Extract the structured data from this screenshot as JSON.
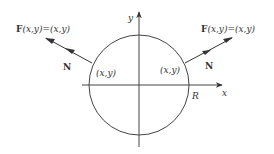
{
  "diagram": {
    "axes": {
      "x_label": "x",
      "y_label": "y"
    },
    "circle": {
      "radius_label": "R"
    },
    "left": {
      "field_label_F": "F",
      "field_label_rest": "(x,y)=(x,y)",
      "normal_label": "N",
      "point_label": "(x,y)"
    },
    "right": {
      "field_label_F": "F",
      "field_label_rest": "(x,y)=(x,y)",
      "normal_label": "N",
      "point_label": "(x,y)"
    },
    "colors": {
      "stroke": "#444444",
      "text": "#333333"
    }
  }
}
